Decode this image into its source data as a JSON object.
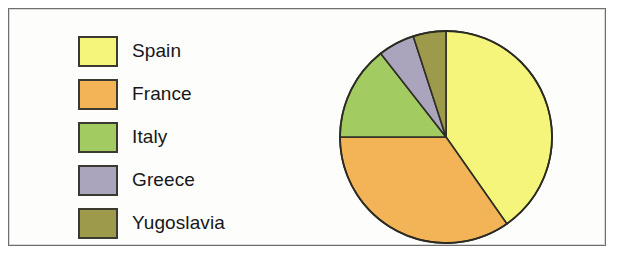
{
  "figure": {
    "frame_color": "#6e6f70",
    "background": "#fdfdfb"
  },
  "legend": {
    "name": "legend",
    "items": [
      {
        "label": "Spain",
        "color": "#F5F57B",
        "swatch_name": "legend-swatch-spain"
      },
      {
        "label": "France",
        "color": "#F3B457",
        "swatch_name": "legend-swatch-france"
      },
      {
        "label": "Italy",
        "color": "#A2CB61",
        "swatch_name": "legend-swatch-italy"
      },
      {
        "label": "Greece",
        "color": "#ABA4BD",
        "swatch_name": "legend-swatch-greece"
      },
      {
        "label": "Yugoslavia",
        "color": "#9D9A4B",
        "swatch_name": "legend-swatch-yugoslavia"
      }
    ]
  },
  "chart_data": {
    "type": "pie",
    "title": "",
    "subtitle": "",
    "xlabel": "",
    "ylabel": "",
    "grid": false,
    "legend_position": "left",
    "start_angle_deg": 0,
    "direction": "clockwise",
    "center": {
      "x": 110,
      "y": 111
    },
    "radius": 106,
    "categories": [
      "Spain",
      "France",
      "Italy",
      "Greece",
      "Yugoslavia"
    ],
    "values": [
      40.3,
      34.7,
      14.4,
      5.6,
      5.0
    ],
    "value_unit": "percent",
    "slices": [
      {
        "name": "Spain",
        "percent": 40.3,
        "angle_deg": 145,
        "color": "#F5F57B"
      },
      {
        "name": "France",
        "percent": 34.7,
        "angle_deg": 125,
        "color": "#F3B457"
      },
      {
        "name": "Italy",
        "percent": 14.4,
        "angle_deg": 52,
        "color": "#A2CB61"
      },
      {
        "name": "Greece",
        "percent": 5.6,
        "angle_deg": 20,
        "color": "#ABA4BD"
      },
      {
        "name": "Yugoslavia",
        "percent": 5.0,
        "angle_deg": 18,
        "color": "#9D9A4B"
      }
    ],
    "annotations": []
  }
}
